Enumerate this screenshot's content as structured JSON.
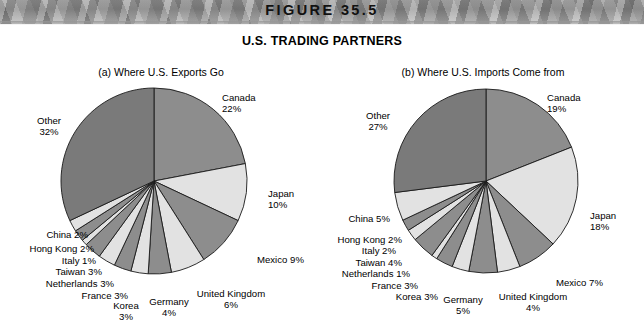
{
  "banner": {
    "figure_label": "FIGURE 35.5"
  },
  "main_title": "U.S. TRADING PARTNERS",
  "colors": {
    "slice_light": "#e2e2e2",
    "slice_mid": "#8d8d8d",
    "slice_dark": "#7a7a7a",
    "outline": "#1a1a1a",
    "banner_gray": "#9b9b9b",
    "bottom_bar": "#0f0f0f",
    "background": "#ffffff",
    "text": "#000000"
  },
  "chart_data": [
    {
      "type": "pie",
      "id": "exports",
      "title": "(a) Where U.S. Exports Go",
      "unit": "percent",
      "start_angle_deg": 0,
      "direction": "clockwise",
      "categories": [
        "Canada",
        "Japan",
        "Mexico",
        "United Kingdom",
        "Germany",
        "Korea",
        "France",
        "Netherlands",
        "Taiwan",
        "Italy",
        "Hong Kong",
        "China",
        "Other"
      ],
      "values": [
        22,
        10,
        9,
        6,
        4,
        3,
        3,
        3,
        3,
        1,
        2,
        2,
        32
      ],
      "labels": [
        {
          "name": "Canada",
          "value": 22,
          "text": "Canada\n22%"
        },
        {
          "name": "Japan",
          "value": 10,
          "text": "Japan\n10%"
        },
        {
          "name": "Mexico",
          "value": 9,
          "text": "Mexico 9%"
        },
        {
          "name": "United Kingdom",
          "value": 6,
          "text": "United Kingdom\n6%"
        },
        {
          "name": "Germany",
          "value": 4,
          "text": "Germany\n4%"
        },
        {
          "name": "Korea",
          "value": 3,
          "text": "Korea\n3%"
        },
        {
          "name": "France",
          "value": 3,
          "text": "France 3%"
        },
        {
          "name": "Netherlands",
          "value": 3,
          "text": "Netherlands 3%"
        },
        {
          "name": "Taiwan",
          "value": 3,
          "text": "Taiwan 3%"
        },
        {
          "name": "Italy",
          "value": 1,
          "text": "Italy 1%"
        },
        {
          "name": "Hong Kong",
          "value": 2,
          "text": "Hong Kong 2%"
        },
        {
          "name": "China",
          "value": 2,
          "text": "China 2%"
        },
        {
          "name": "Other",
          "value": 32,
          "text": "Other\n32%"
        }
      ]
    },
    {
      "type": "pie",
      "id": "imports",
      "title": "(b) Where U.S. Imports Come from",
      "unit": "percent",
      "start_angle_deg": 0,
      "direction": "clockwise",
      "categories": [
        "Canada",
        "Japan",
        "Mexico",
        "United Kingdom",
        "Germany",
        "Korea",
        "France",
        "Netherlands",
        "Taiwan",
        "Italy",
        "Hong Kong",
        "China",
        "Other"
      ],
      "values": [
        19,
        18,
        7,
        4,
        5,
        3,
        3,
        1,
        4,
        2,
        2,
        5,
        27
      ],
      "labels": [
        {
          "name": "Canada",
          "value": 19,
          "text": "Canada\n19%"
        },
        {
          "name": "Japan",
          "value": 18,
          "text": "Japan\n18%"
        },
        {
          "name": "Mexico",
          "value": 7,
          "text": "Mexico 7%"
        },
        {
          "name": "United Kingdom",
          "value": 4,
          "text": "United Kingdom\n4%"
        },
        {
          "name": "Germany",
          "value": 5,
          "text": "Germany\n5%"
        },
        {
          "name": "Korea",
          "value": 3,
          "text": "Korea 3%"
        },
        {
          "name": "France",
          "value": 3,
          "text": "France 3%"
        },
        {
          "name": "Netherlands",
          "value": 1,
          "text": "Netherlands 1%"
        },
        {
          "name": "Taiwan",
          "value": 4,
          "text": "Taiwan 4%"
        },
        {
          "name": "Italy",
          "value": 2,
          "text": "Italy 2%"
        },
        {
          "name": "Hong Kong",
          "value": 2,
          "text": "Hong Kong 2%"
        },
        {
          "name": "China",
          "value": 5,
          "text": "China 5%"
        },
        {
          "name": "Other",
          "value": 27,
          "text": "Other\n27%"
        }
      ]
    }
  ],
  "panel_a_labels": {
    "canada": "Canada\n22%",
    "japan": "Japan\n10%",
    "mexico": "Mexico 9%",
    "uk": "United Kingdom\n6%",
    "germany": "Germany\n4%",
    "korea": "Korea\n3%",
    "france": "France 3%",
    "netherlands": "Netherlands 3%",
    "taiwan": "Taiwan 3%",
    "italy": "Italy 1%",
    "hongkong": "Hong Kong 2%",
    "china": "China 2%",
    "other": "Other\n32%"
  },
  "panel_b_labels": {
    "canada": "Canada\n19%",
    "japan": "Japan\n18%",
    "mexico": "Mexico 7%",
    "uk": "United Kingdom\n4%",
    "germany": "Germany\n5%",
    "korea": "Korea 3%",
    "france": "France 3%",
    "netherlands": "Netherlands 1%",
    "taiwan": "Taiwan 4%",
    "italy": "Italy 2%",
    "hongkong": "Hong Kong 2%",
    "china": "China 5%",
    "other": "Other\n27%"
  }
}
